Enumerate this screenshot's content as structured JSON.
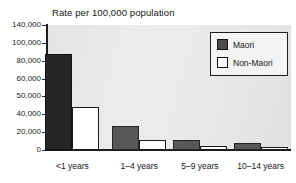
{
  "chart_data": {
    "type": "bar",
    "title": "Rate per 100,000 population",
    "xlabel": "",
    "ylabel": "",
    "grid": false,
    "legend_position": "top-right",
    "categories": [
      "<1 years",
      "1–4 years",
      "5–9 years",
      "10–14 years"
    ],
    "ytick_labels": [
      "140,000",
      "100,000",
      "80,000",
      "60,000",
      "50,000",
      "40,000",
      "20,000",
      "0"
    ],
    "ytick_values": [
      140000,
      100000,
      80000,
      60000,
      50000,
      40000,
      20000,
      0
    ],
    "ylim": [
      0,
      140000
    ],
    "series": [
      {
        "name": "Maori",
        "color": "#262626",
        "values": [
          108000,
          27000,
          11000,
          8000
        ]
      },
      {
        "name": "Non-Maori",
        "color": "#ffffff",
        "values": [
          48000,
          11500,
          5000,
          3500
        ]
      }
    ]
  },
  "legend": {
    "entries": [
      {
        "label": "Maori",
        "swatch": "dark"
      },
      {
        "label": "Non-Maori",
        "swatch": "light"
      }
    ]
  }
}
